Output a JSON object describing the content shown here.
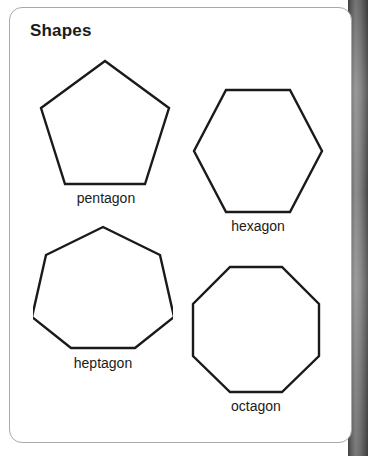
{
  "page": {
    "background_color": "#ffffff",
    "card": {
      "title": "Shapes",
      "background_color": "#ffffff",
      "border_color": "#a9a9a9"
    },
    "binding_strip": {
      "name": "book-spine",
      "color_dark": "#4a4a4a",
      "color_light": "#8e8e8e"
    }
  },
  "figures": [
    {
      "id": "pentagon",
      "label": "pentagon",
      "sides": 5,
      "orientation": "vertex-up",
      "stroke_color": "#1a1a1a",
      "fill_color": "#ffffff"
    },
    {
      "id": "hexagon",
      "label": "hexagon",
      "sides": 6,
      "orientation": "flat-top",
      "stroke_color": "#1a1a1a",
      "fill_color": "#ffffff"
    },
    {
      "id": "heptagon",
      "label": "heptagon",
      "sides": 7,
      "orientation": "vertex-up",
      "stroke_color": "#1a1a1a",
      "fill_color": "#ffffff"
    },
    {
      "id": "octagon",
      "label": "octagon",
      "sides": 8,
      "orientation": "flat-top",
      "stroke_color": "#1a1a1a",
      "fill_color": "#ffffff"
    }
  ]
}
